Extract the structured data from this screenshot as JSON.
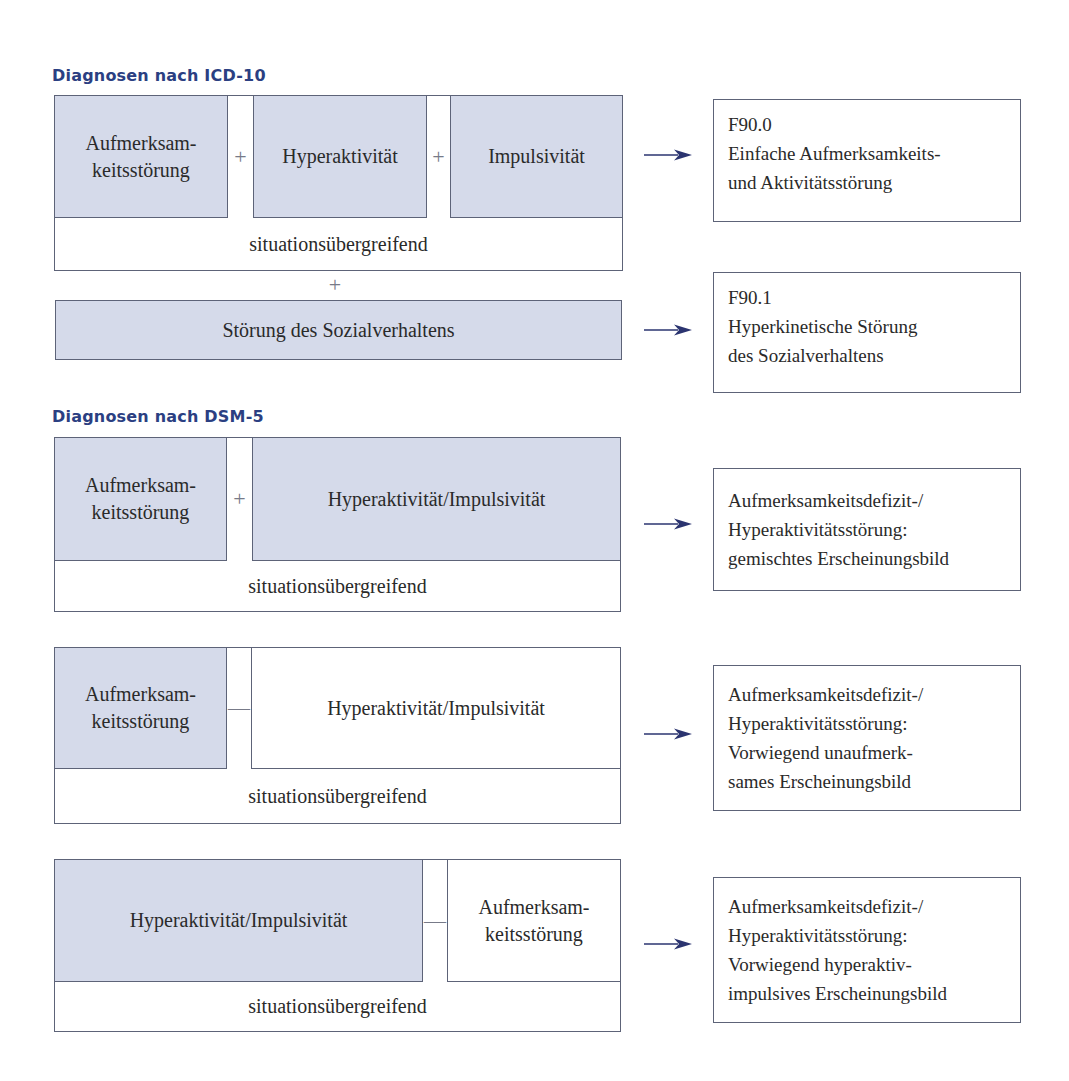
{
  "icd10": {
    "heading": "Diagnosen nach ICD-10",
    "symptoms": [
      {
        "label": "Aufmerksam-\nkeitsstörung",
        "line1": "Aufmerksam-",
        "line2": "keitsstörung",
        "shaded": true
      },
      {
        "label": "Hyperaktivität",
        "shaded": true
      },
      {
        "label": "Impulsivität",
        "shaded": true
      }
    ],
    "operators": [
      "+",
      "+"
    ],
    "footer": "situationsübergreifend",
    "plus_between": "+",
    "extra": {
      "label": "Störung des Sozialverhaltens",
      "shaded": true
    },
    "results": [
      {
        "code": "F90.0",
        "lines": [
          "F90.0",
          "Einfache Aufmerksamkeits-",
          "und Aktivitätsstörung"
        ]
      },
      {
        "code": "F90.1",
        "lines": [
          "F90.1",
          "Hyperkinetische Störung",
          "des Sozialverhaltens"
        ]
      }
    ]
  },
  "dsm5": {
    "heading": "Diagnosen nach DSM-5",
    "blocks": [
      {
        "left": {
          "line1": "Aufmerksam-",
          "line2": "keitsstörung",
          "shaded": true
        },
        "operator": "+",
        "right": {
          "label": "Hyperaktivität/Impulsivität",
          "shaded": true
        },
        "footer": "situationsübergreifend",
        "result": [
          "Aufmerksamkeitsdefizit-/",
          "Hyperaktivitätsstörung:",
          "gemischtes Erscheinungsbild"
        ]
      },
      {
        "left": {
          "line1": "Aufmerksam-",
          "line2": "keitsstörung",
          "shaded": true
        },
        "operator": "—",
        "right": {
          "label": "Hyperaktivität/Impulsivität",
          "shaded": false
        },
        "footer": "situationsübergreifend",
        "result": [
          "Aufmerksamkeitsdefizit-/",
          "Hyperaktivitätsstörung:",
          "Vorwiegend unaufmerk-",
          "sames Erscheinungsbild"
        ]
      },
      {
        "left": {
          "label": "Hyperaktivität/Impulsivität",
          "shaded": true
        },
        "operator": "—",
        "right": {
          "line1": "Aufmerksam-",
          "line2": "keitsstörung",
          "shaded": false
        },
        "footer": "situationsübergreifend",
        "result": [
          "Aufmerksamkeitsdefizit-/",
          "Hyperaktivitätsstörung:",
          "Vorwiegend hyperaktiv-",
          "impulsives Erscheinungsbild"
        ]
      }
    ]
  },
  "colors": {
    "heading": "#2b3f82",
    "shaded_fill": "#d5daea",
    "border": "#5d6378",
    "arrow": "#2b3470",
    "text": "#2a2a2a"
  },
  "arrow_icon": "right-arrow-icon"
}
